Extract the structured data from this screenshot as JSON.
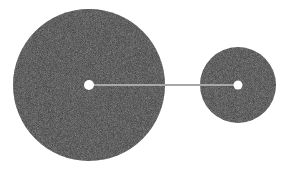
{
  "diagram": {
    "width": 294,
    "height": 171,
    "background": "#ffffff",
    "bodies": [
      {
        "name": "large-body",
        "cx": 89,
        "cy": 85,
        "r": 76,
        "fill": "#3b3b3b",
        "center_dot": {
          "r": 5,
          "fill": "#ffffff"
        }
      },
      {
        "name": "small-body",
        "cx": 238,
        "cy": 85,
        "r": 38,
        "fill": "#3d3d3d",
        "center_dot": {
          "r": 4.5,
          "fill": "#ffffff"
        }
      }
    ],
    "connector": {
      "x1": 91,
      "y1": 85,
      "x2": 236,
      "y2": 85,
      "stroke": "#a8a8a8",
      "width": 2
    }
  }
}
